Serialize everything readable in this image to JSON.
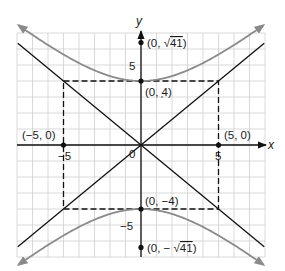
{
  "chart_data": {
    "type": "line",
    "title": "",
    "xlabel": "x",
    "ylabel": "y",
    "xlim": [
      -8,
      8
    ],
    "ylim": [
      -7,
      7
    ],
    "grid": true,
    "x_ticks": [
      {
        "value": -5,
        "label": "−5"
      },
      {
        "value": 5,
        "label": "5"
      }
    ],
    "y_ticks": [
      {
        "value": 5,
        "label": "5"
      },
      {
        "value": -5,
        "label": "−5"
      }
    ],
    "origin_label": "0",
    "hyperbola": {
      "a": 4,
      "b": 5,
      "orientation": "vertical",
      "color": "#8a8a8a"
    },
    "asymptotes": [
      {
        "slope": 0.8,
        "color": "#111111"
      },
      {
        "slope": -0.8,
        "color": "#111111"
      }
    ],
    "rectangle": {
      "x": [
        -5,
        5
      ],
      "y": [
        -4,
        4
      ],
      "style": "dashed"
    },
    "points": [
      {
        "x": 0,
        "y": 6.403,
        "label": "(0, √41)"
      },
      {
        "x": 0,
        "y": 4,
        "label": "(0, 4)"
      },
      {
        "x": -5,
        "y": 0,
        "label": "(−5, 0)"
      },
      {
        "x": 5,
        "y": 0,
        "label": "(5, 0)"
      },
      {
        "x": 0,
        "y": -4,
        "label": "(0, −4)"
      },
      {
        "x": 0,
        "y": -6.403,
        "label": "(0, −√41)"
      }
    ]
  },
  "labels": {
    "x_axis": "x",
    "y_axis": "y",
    "origin": "0",
    "tick_x_neg5": "−5",
    "tick_x_5": "5",
    "tick_y_5": "5",
    "tick_y_neg5": "−5",
    "focus_top_prefix": "(0, ",
    "focus_top_sqrt": "√",
    "focus_top_rad": "41",
    "focus_top_suffix": ")",
    "vertex_top": "(0, 4)",
    "point_left": "(−5, 0)",
    "point_right": "(5, 0)",
    "vertex_bottom": "(0, −4)",
    "focus_bottom_prefix": "(0, − ",
    "focus_bottom_sqrt": "√",
    "focus_bottom_rad": "41",
    "focus_bottom_suffix": ")"
  },
  "colors": {
    "grid": "#cfcfcf",
    "axis": "#111111",
    "curve": "#8a8a8a",
    "asymptote": "#111111",
    "rectangle": "#111111"
  }
}
